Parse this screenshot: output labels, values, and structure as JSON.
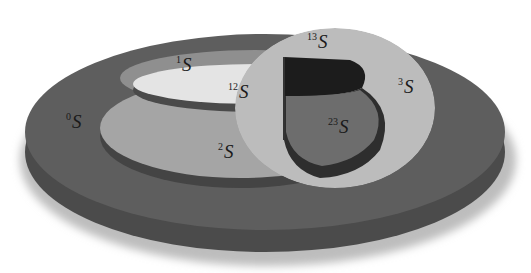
{
  "diagram": {
    "type": "3d-nested-disk-venn",
    "colors": {
      "background": "#ffffff",
      "outer_disk_top": "#5f5f5f",
      "outer_disk_side": "#4a4a4a",
      "region_1": "#9a9a9a",
      "region_12": "#e6e6e6",
      "region_2": "#a6a6a6",
      "region_3": "#bcbcbc",
      "region_13": "#1a1a1a",
      "region_23": "#6e6e6e",
      "wall_dark": "#333333",
      "wall_mid": "#7a7a7a"
    },
    "labels": [
      {
        "id": "S0",
        "sup": "0",
        "base": "S"
      },
      {
        "id": "S1",
        "sup": "1",
        "base": "S"
      },
      {
        "id": "S2",
        "sup": "2",
        "base": "S"
      },
      {
        "id": "S3",
        "sup": "3",
        "base": "S"
      },
      {
        "id": "S12",
        "sup": "12",
        "base": "S"
      },
      {
        "id": "S13",
        "sup": "13",
        "base": "S"
      },
      {
        "id": "S23",
        "sup": "23",
        "base": "S"
      }
    ]
  }
}
